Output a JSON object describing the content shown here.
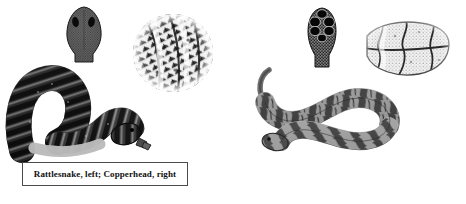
{
  "figure": {
    "background_color": "#ffffff",
    "width": 466,
    "height": 204,
    "caption": "Rattlesnake, left; Copperhead, right"
  },
  "caption_box": {
    "text": "Rattlesnake, left; Copperhead, right",
    "border_color": "#4b4b4b",
    "text_color": "#111111"
  },
  "panels": {
    "left": {
      "subject": "Rattlesnake",
      "ink_color": "#2b2b2b",
      "figures": [
        {
          "name": "rattlesnake-head-dorsal",
          "description": "triangular head, top view, fine keeled scales, two dark eyes"
        },
        {
          "name": "rattlesnake-scale-detail",
          "description": "circular inset of keeled dorsal scales"
        },
        {
          "name": "rattlesnake-body",
          "description": "dark coiled body with banded blotches and rattle"
        }
      ]
    },
    "right": {
      "subject": "Copperhead",
      "ink_color": "#6e6e6e",
      "figures": [
        {
          "name": "copperhead-head-dorsal",
          "description": "narrow head, top view, large dark crown plates"
        },
        {
          "name": "copperhead-scale-detail",
          "description": "sketch of hourglass band pattern"
        },
        {
          "name": "copperhead-body",
          "description": "lighter snake with hourglass crossbands and curled tail"
        }
      ]
    }
  }
}
